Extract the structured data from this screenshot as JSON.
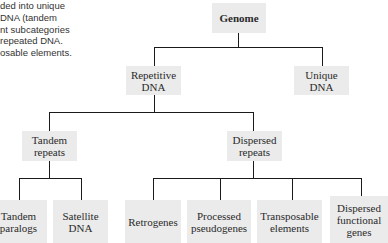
{
  "caption": {
    "lines": [
      "ded into unique",
      " DNA (tandem",
      "nt subcategories",
      " repeated DNA.",
      "osable elements."
    ]
  },
  "diagram": {
    "root": {
      "label": "Genome"
    },
    "level1": [
      {
        "label": "Repetitive\nDNA"
      },
      {
        "label": "Unique\nDNA"
      }
    ],
    "level2": [
      {
        "label": "Tandem\nrepeats"
      },
      {
        "label": "Dispersed\nrepeats"
      }
    ],
    "leaves": [
      {
        "label": "Tandem\nparalogs"
      },
      {
        "label": "Satellite\nDNA"
      },
      {
        "label": "Retrogenes"
      },
      {
        "label": "Processed\npseudogenes"
      },
      {
        "label": "Transposable\nelements"
      },
      {
        "label": "Dispersed\nfunctional\ngenes"
      }
    ],
    "colors": {
      "box": "#ebebeb",
      "line": "#1a1a1a"
    }
  }
}
